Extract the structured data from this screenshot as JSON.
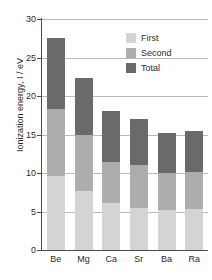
{
  "chart_data": {
    "type": "bar",
    "title": "",
    "subtitle": "",
    "xlabel": "",
    "ylabel": "Ionization energy, I / eV",
    "ylim": [
      0,
      30
    ],
    "yticks": [
      0,
      5,
      10,
      15,
      20,
      25,
      30
    ],
    "ytick_labels": [
      "0",
      "5",
      "10",
      "15",
      "20",
      "25",
      "30"
    ],
    "grid": true,
    "legend_position": "top-right",
    "categories": [
      "Be",
      "Mg",
      "Ca",
      "Sr",
      "Ba",
      "Ra"
    ],
    "stacking": "cumulative",
    "note": "Bar segments are cumulative from the baseline: the light segment top equals the first ionization energy, the medium segment top equals first+second, and the dark segment top equals the total.",
    "series": [
      {
        "name": "First",
        "color": "#d4d4d4",
        "values": [
          9.6,
          7.6,
          6.1,
          5.5,
          5.2,
          5.3
        ]
      },
      {
        "name": "Second",
        "color": "#adadad",
        "values": [
          18.3,
          15.0,
          11.4,
          11.1,
          10.0,
          10.1
        ]
      },
      {
        "name": "Total",
        "color": "#6a6a6a",
        "values": [
          27.5,
          22.3,
          18.0,
          17.0,
          15.2,
          15.4
        ]
      }
    ]
  },
  "legend": {
    "items": [
      {
        "label": "First",
        "color": "#d4d4d4"
      },
      {
        "label": "Second",
        "color": "#adadad"
      },
      {
        "label": "Total",
        "color": "#6a6a6a"
      }
    ]
  },
  "axes": {
    "y_title": "Ionization energy, I / eV"
  }
}
